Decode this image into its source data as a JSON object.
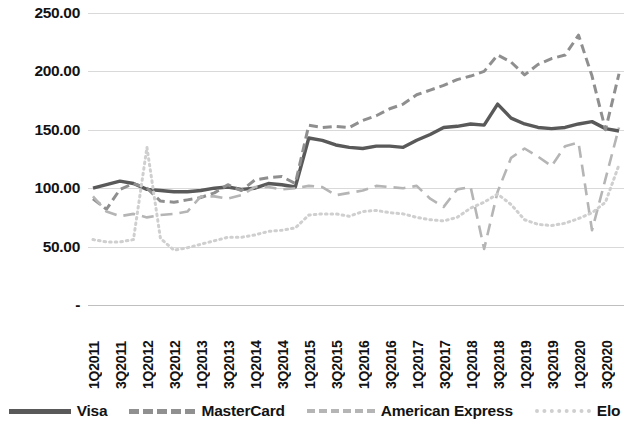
{
  "chart_data": {
    "type": "line",
    "title": "",
    "xlabel": "",
    "ylabel": "",
    "ylim": [
      0,
      250
    ],
    "yticks": [
      250,
      200,
      150,
      100,
      50,
      0
    ],
    "ytick_labels": [
      "250.00",
      "200.00",
      "150.00",
      "100.00",
      "50.00",
      "-"
    ],
    "grid": true,
    "legend_position": "bottom",
    "categories": [
      "1Q2011",
      "2Q2011",
      "3Q2011",
      "4Q2011",
      "1Q2012",
      "2Q2012",
      "3Q2012",
      "4Q2012",
      "1Q2013",
      "2Q2013",
      "3Q2013",
      "4Q2013",
      "1Q2014",
      "2Q2014",
      "3Q2014",
      "4Q2014",
      "1Q2015",
      "2Q2015",
      "3Q2015",
      "4Q2015",
      "1Q2016",
      "2Q2016",
      "3Q2016",
      "4Q2016",
      "1Q2017",
      "2Q2017",
      "3Q2017",
      "4Q2017",
      "1Q2018",
      "2Q2018",
      "3Q2018",
      "4Q2018",
      "1Q2019",
      "2Q2019",
      "3Q2019",
      "4Q2019",
      "1Q2020",
      "2Q2020",
      "3Q2020",
      "4Q2020"
    ],
    "xtick_labels": [
      "1Q2011",
      "3Q2011",
      "1Q2012",
      "3Q2012",
      "1Q2013",
      "3Q2013",
      "1Q2014",
      "3Q2014",
      "1Q2015",
      "3Q2015",
      "1Q2016",
      "3Q2016",
      "1Q2017",
      "3Q2017",
      "1Q2018",
      "3Q2018",
      "1Q2019",
      "3Q2019",
      "1Q2020",
      "3Q2020"
    ],
    "series": [
      {
        "name": "Visa",
        "style": "solid",
        "color": "#595959",
        "values": [
          100,
          103,
          106,
          104,
          99,
          98,
          97,
          97,
          98,
          100,
          101,
          99,
          100,
          104,
          103,
          101,
          143,
          141,
          137,
          135,
          134,
          136,
          136,
          135,
          141,
          146,
          152,
          153,
          155,
          154,
          172,
          160,
          155,
          152,
          151,
          152,
          155,
          157,
          151,
          149
        ]
      },
      {
        "name": "MasterCard",
        "style": "dashed",
        "color": "#8f8f8f",
        "values": [
          91,
          82,
          99,
          104,
          100,
          89,
          88,
          90,
          92,
          96,
          103,
          98,
          107,
          109,
          110,
          104,
          154,
          152,
          153,
          152,
          158,
          162,
          168,
          172,
          180,
          184,
          188,
          193,
          196,
          200,
          214,
          208,
          197,
          206,
          211,
          214,
          231,
          196,
          150,
          198
        ]
      },
      {
        "name": "American Express",
        "style": "longdash",
        "color": "#b5b5b5",
        "values": [
          93,
          80,
          76,
          78,
          75,
          77,
          78,
          80,
          93,
          93,
          91,
          94,
          101,
          101,
          99,
          100,
          102,
          101,
          94,
          96,
          98,
          102,
          101,
          100,
          102,
          91,
          84,
          99,
          101,
          48,
          97,
          126,
          134,
          127,
          119,
          136,
          139,
          64,
          108,
          152
        ]
      },
      {
        "name": "Elo",
        "style": "dotted",
        "color": "#cfcfcf",
        "values": [
          56,
          54,
          54,
          56,
          135,
          57,
          47,
          49,
          52,
          55,
          58,
          58,
          60,
          63,
          64,
          66,
          77,
          78,
          78,
          76,
          80,
          81,
          79,
          78,
          75,
          73,
          72,
          75,
          83,
          88,
          95,
          86,
          73,
          69,
          68,
          70,
          74,
          79,
          88,
          120
        ]
      }
    ]
  },
  "axis": {
    "y_labels": [
      "250.00",
      "200.00",
      "150.00",
      "100.00",
      "50.00",
      "-"
    ]
  },
  "legend": {
    "items": [
      {
        "label": "Visa",
        "swatch": "solid-line-swatch"
      },
      {
        "label": "MasterCard",
        "swatch": "dashed-line-swatch"
      },
      {
        "label": "American Express",
        "swatch": "longdash-line-swatch"
      },
      {
        "label": "Elo",
        "swatch": "dotted-line-swatch"
      }
    ]
  }
}
